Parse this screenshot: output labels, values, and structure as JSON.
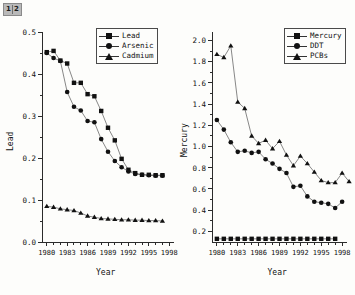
{
  "badge": {
    "left_label": "1",
    "right_label": "2"
  },
  "charts": [
    {
      "id": "left",
      "ylabel": "Lead",
      "xlabel": "Year",
      "yticks": [
        "0.0",
        "0.1",
        "0.2",
        "0.3",
        "0.4",
        "0.5"
      ],
      "xticks": [
        "1980",
        "1983",
        "1986",
        "1989",
        "1992",
        "1995",
        "1998"
      ],
      "legend": [
        {
          "label": "Lead",
          "marker": "square"
        },
        {
          "label": "Arsenic",
          "marker": "circle"
        },
        {
          "label": "Cadmium",
          "marker": "triangle"
        }
      ]
    },
    {
      "id": "right",
      "ylabel": "Mercury",
      "xlabel": "Year",
      "yticks": [
        "0.2",
        "0.4",
        "0.6",
        "0.8",
        "1.0",
        "1.2",
        "1.4",
        "1.6",
        "1.8",
        "2.0"
      ],
      "xticks": [
        "1980",
        "1983",
        "1986",
        "1989",
        "1992",
        "1995",
        "1998"
      ],
      "legend": [
        {
          "label": "Mercury",
          "marker": "square"
        },
        {
          "label": "DDT",
          "marker": "circle"
        },
        {
          "label": "PCBs",
          "marker": "triangle"
        }
      ]
    }
  ],
  "chart_data": [
    {
      "type": "line",
      "title": "",
      "xlabel": "Year",
      "ylabel": "Lead",
      "xlim": [
        1979.3,
        1998.7
      ],
      "ylim": [
        0.0,
        0.5
      ],
      "grid": false,
      "legend_position": "top-right",
      "x": [
        1980,
        1981,
        1982,
        1983,
        1984,
        1985,
        1986,
        1987,
        1988,
        1989,
        1990,
        1991,
        1992,
        1993,
        1994,
        1995,
        1996,
        1997
      ],
      "series": [
        {
          "name": "Lead",
          "marker": "square",
          "values": [
            0.452,
            0.455,
            0.432,
            0.425,
            0.379,
            0.379,
            0.352,
            0.347,
            0.312,
            0.272,
            0.242,
            0.198,
            0.172,
            0.164,
            0.16,
            0.16,
            0.159,
            0.159
          ]
        },
        {
          "name": "Arsenic",
          "marker": "circle",
          "values": [
            0.45,
            0.438,
            0.431,
            0.357,
            0.322,
            0.313,
            0.288,
            0.285,
            0.245,
            0.215,
            0.193,
            0.178,
            0.168,
            0.162,
            0.16,
            0.159,
            0.158,
            0.158
          ]
        },
        {
          "name": "Cadmium",
          "marker": "triangle",
          "values": [
            0.085,
            0.083,
            0.079,
            0.077,
            0.075,
            0.069,
            0.062,
            0.059,
            0.056,
            0.055,
            0.054,
            0.053,
            0.053,
            0.052,
            0.052,
            0.051,
            0.051,
            0.05
          ]
        }
      ]
    },
    {
      "type": "line",
      "title": "",
      "xlabel": "Year",
      "ylabel": "Mercury",
      "xlim": [
        1979.3,
        1998.7
      ],
      "ylim": [
        0.1,
        2.08
      ],
      "grid": false,
      "legend_position": "top-right",
      "x": [
        1980,
        1981,
        1982,
        1983,
        1984,
        1985,
        1986,
        1987,
        1988,
        1989,
        1990,
        1991,
        1992,
        1993,
        1994,
        1995,
        1996,
        1997
      ],
      "series": [
        {
          "name": "Mercury",
          "marker": "square",
          "values": [
            0.13,
            0.13,
            0.13,
            0.13,
            0.13,
            0.13,
            0.13,
            0.13,
            0.13,
            0.13,
            0.13,
            0.13,
            0.13,
            0.13,
            0.13,
            0.13,
            0.13,
            0.13
          ]
        },
        {
          "name": "DDT",
          "marker": "circle",
          "values": [
            1.25,
            1.16,
            1.04,
            0.95,
            0.96,
            0.94,
            0.95,
            0.88,
            0.84,
            0.79,
            0.75,
            0.62,
            0.63,
            0.53,
            0.48,
            0.47,
            0.46,
            0.42,
            0.48
          ]
        },
        {
          "name": "PCBs",
          "marker": "triangle",
          "values": [
            1.87,
            1.84,
            1.95,
            1.42,
            1.36,
            1.1,
            1.03,
            1.06,
            0.98,
            1.05,
            0.92,
            0.82,
            0.91,
            0.84,
            0.76,
            0.68,
            0.66,
            0.66,
            0.75,
            0.67
          ]
        }
      ]
    }
  ]
}
